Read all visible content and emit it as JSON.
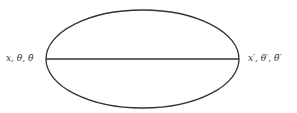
{
  "diagram": {
    "type": "feynman-like-ellipse",
    "ellipse": {
      "cx": 142.5,
      "cy": 59,
      "rx": 96.5,
      "ry": 49,
      "stroke": "#333333",
      "stroke_width": 1.3
    },
    "chord": {
      "x1": 46,
      "y1": 59,
      "x2": 239,
      "y2": 59,
      "stroke": "#333333",
      "stroke_width": 1.3
    },
    "labels": {
      "left": "x, θ, θ̄",
      "right": "x′, θ′, θ̄′"
    }
  }
}
